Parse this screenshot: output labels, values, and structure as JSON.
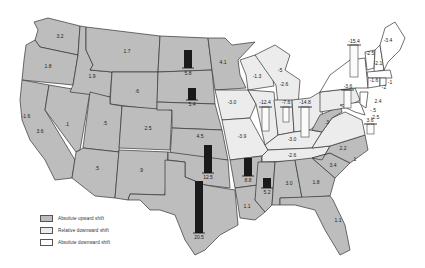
{
  "legend": {
    "items": [
      {
        "label": "Absolute upward shift",
        "color": "#bdbdbd"
      },
      {
        "label": "Relative downward shift",
        "color": "#ececec"
      },
      {
        "label": "Absolute downward shift",
        "color": "#ffffff"
      }
    ]
  },
  "colors": {
    "absolute_upward": "#bdbdbd",
    "relative_downward": "#ececec",
    "absolute_downward": "#ffffff",
    "bar": "#1a1a1a"
  },
  "states": {
    "WA": "3.2",
    "OR": "1.8",
    "CA": "3.6",
    "CA_coast": "-1.6",
    "ID": "1.9",
    "NV": ".1",
    "MT": "1.7",
    "WY": ".6",
    "UT": ".5",
    "CO": "2.5",
    "AZ": ".5",
    "NM": ".9",
    "ND": "5.8",
    "SD": "5.4",
    "NE": "4.5",
    "KS": "4.5",
    "OK": "12.5",
    "TX": "20.5",
    "MN": "4.1",
    "IA": "-3.0",
    "MO": "-3.9",
    "AR": "8.8",
    "LA": "1.1",
    "WI": "-1.3",
    "MI": "-2.6",
    "MI_n": "-5",
    "IL": "-12.4",
    "IN": "-7.6",
    "OH": "-14.8",
    "KY": "-3.0",
    "TN": "-2.6",
    "MS": "5.2",
    "AL": "3.0",
    "GA": "1.8",
    "FL": "1.1",
    "SC": "3.4",
    "NC": "2.2",
    "VA_e": "1",
    "WV": ".3",
    "PA": "-3.6",
    "NY": "-15.4",
    "ME": "-3.4",
    "VT": "-2.5",
    "NH": "-2.1",
    "MA": "-1.6",
    "RI": "-1",
    "CT": "-2",
    "NJ": "2.4",
    "DE": "-.5",
    "MD": "-2.5",
    "VA": "3.6"
  }
}
